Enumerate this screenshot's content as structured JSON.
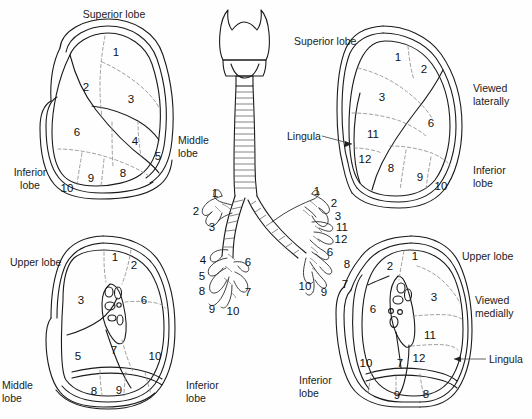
{
  "figure": {
    "ink_color": "#1a1a1a",
    "dashed_color": "#8d8d8d",
    "background": "#fefefe"
  },
  "panels": {
    "top_left": {
      "name": "right-lung-lateral",
      "orientation_note": "",
      "labels": [
        {
          "text": "Superior lobe",
          "x": 112,
          "y": 14,
          "align": "center"
        },
        {
          "text": "Middle\nlobe",
          "x": 186,
          "y": 140,
          "align": "left"
        },
        {
          "text": "Inferior\nlobe",
          "x": 30,
          "y": 170,
          "align": "center"
        }
      ],
      "segments": [
        {
          "num": "1",
          "x": 116,
          "y": 53
        },
        {
          "num": "2",
          "x": 86,
          "y": 88
        },
        {
          "num": "3",
          "x": 131,
          "y": 100
        },
        {
          "num": "4",
          "x": 135,
          "y": 142
        },
        {
          "num": "5",
          "x": 158,
          "y": 157
        },
        {
          "num": "6",
          "x": 77,
          "y": 133
        },
        {
          "num": "8",
          "x": 123,
          "y": 174
        },
        {
          "num": "9",
          "x": 91,
          "y": 179
        },
        {
          "num": "10",
          "x": 67,
          "y": 189
        }
      ]
    },
    "top_right": {
      "name": "left-lung-lateral",
      "labels": [
        {
          "text": "Superior lobe",
          "x": 332,
          "y": 40,
          "align": "left"
        },
        {
          "text": "Viewed\nlaterally",
          "x": 472,
          "y": 88,
          "align": "left"
        },
        {
          "text": "Lingula",
          "x": 293,
          "y": 135,
          "align": "left"
        },
        {
          "text": "Inferior\nlobe",
          "x": 474,
          "y": 168,
          "align": "left"
        }
      ],
      "segments": [
        {
          "num": "1",
          "x": 398,
          "y": 58
        },
        {
          "num": "2",
          "x": 424,
          "y": 70
        },
        {
          "num": "3",
          "x": 382,
          "y": 98
        },
        {
          "num": "6",
          "x": 431,
          "y": 124
        },
        {
          "num": "8",
          "x": 391,
          "y": 169
        },
        {
          "num": "9",
          "x": 420,
          "y": 178
        },
        {
          "num": "10",
          "x": 441,
          "y": 187
        },
        {
          "num": "11",
          "x": 373,
          "y": 135
        },
        {
          "num": "12",
          "x": 365,
          "y": 160
        }
      ]
    },
    "bottom_left": {
      "name": "left-lung-medial-lower",
      "labels": [
        {
          "text": "Upper lobe",
          "x": 15,
          "y": 261,
          "align": "left"
        },
        {
          "text": "Middle\nlobe",
          "x": 5,
          "y": 385,
          "align": "left"
        },
        {
          "text": "Inferior\nlobe",
          "x": 188,
          "y": 385,
          "align": "left"
        }
      ],
      "segments": [
        {
          "num": "1",
          "x": 115,
          "y": 258
        },
        {
          "num": "2",
          "x": 134,
          "y": 266
        },
        {
          "num": "3",
          "x": 81,
          "y": 301
        },
        {
          "num": "5",
          "x": 78,
          "y": 357
        },
        {
          "num": "6",
          "x": 144,
          "y": 301
        },
        {
          "num": "7",
          "x": 114,
          "y": 351
        },
        {
          "num": "8",
          "x": 94,
          "y": 392
        },
        {
          "num": "9",
          "x": 119,
          "y": 391
        },
        {
          "num": "10",
          "x": 155,
          "y": 357
        }
      ]
    },
    "bottom_right": {
      "name": "left-lung-medial",
      "labels": [
        {
          "text": "Upper lobe",
          "x": 464,
          "y": 255,
          "align": "left"
        },
        {
          "text": "Viewed\nmedially",
          "x": 476,
          "y": 300,
          "align": "left"
        },
        {
          "text": "Lingula",
          "x": 489,
          "y": 358,
          "align": "left"
        },
        {
          "text": "Inferior\nlobe",
          "x": 301,
          "y": 380,
          "align": "left"
        }
      ],
      "segments": [
        {
          "num": "1",
          "x": 415,
          "y": 257
        },
        {
          "num": "2",
          "x": 390,
          "y": 267
        },
        {
          "num": "3",
          "x": 434,
          "y": 298
        },
        {
          "num": "6",
          "x": 373,
          "y": 310
        },
        {
          "num": "7",
          "x": 400,
          "y": 364
        },
        {
          "num": "8",
          "x": 426,
          "y": 395
        },
        {
          "num": "9",
          "x": 397,
          "y": 396
        },
        {
          "num": "10",
          "x": 366,
          "y": 364
        },
        {
          "num": "11",
          "x": 430,
          "y": 336
        },
        {
          "num": "12",
          "x": 419,
          "y": 359
        }
      ]
    },
    "center": {
      "name": "tracheobronchial-tree",
      "left_branch_segments": [
        {
          "num": "1",
          "x": 215,
          "y": 194
        },
        {
          "num": "2",
          "x": 196,
          "y": 212
        },
        {
          "num": "3",
          "x": 212,
          "y": 228
        },
        {
          "num": "4",
          "x": 203,
          "y": 261
        },
        {
          "num": "5",
          "x": 202,
          "y": 277
        },
        {
          "num": "6",
          "x": 248,
          "y": 263
        },
        {
          "num": "7",
          "x": 248,
          "y": 293
        },
        {
          "num": "8",
          "x": 202,
          "y": 292
        },
        {
          "num": "9",
          "x": 212,
          "y": 310
        },
        {
          "num": "10",
          "x": 233,
          "y": 312
        }
      ],
      "right_branch_segments": [
        {
          "num": "1",
          "x": 317,
          "y": 192
        },
        {
          "num": "2",
          "x": 334,
          "y": 204
        },
        {
          "num": "3",
          "x": 338,
          "y": 217
        },
        {
          "num": "6",
          "x": 330,
          "y": 253
        },
        {
          "num": "7",
          "x": 345,
          "y": 285
        },
        {
          "num": "8",
          "x": 347,
          "y": 265
        },
        {
          "num": "9",
          "x": 324,
          "y": 293
        },
        {
          "num": "10",
          "x": 305,
          "y": 287
        },
        {
          "num": "11",
          "x": 342,
          "y": 228
        },
        {
          "num": "12",
          "x": 341,
          "y": 240
        }
      ]
    }
  }
}
